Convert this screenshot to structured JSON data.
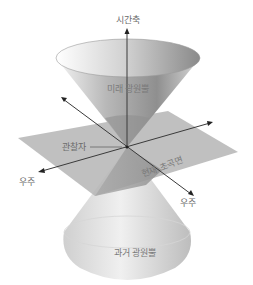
{
  "diagram": {
    "type": "light-cone",
    "labels": {
      "time_axis": "시간축",
      "future_cone": "미래 광원뿔",
      "observer": "관찰자",
      "present_hypersurface": "현재 초곡면",
      "space_left": "우주",
      "space_right": "우주",
      "past_cone": "과거 광원뿔"
    },
    "colors": {
      "cone_dark": "#8c8c8c",
      "cone_light": "#f2f2f2",
      "plane": "#b3b3b3",
      "axis": "#3a3a3a",
      "label": "#6b6b6b"
    }
  }
}
